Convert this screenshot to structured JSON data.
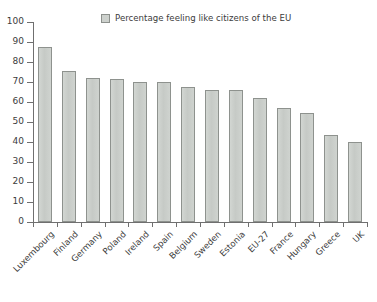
{
  "chart_data": {
    "type": "bar",
    "title": "",
    "subtitle": "",
    "xlabel": "",
    "ylabel": "",
    "ylim": [
      0,
      100
    ],
    "ytick_step": 10,
    "yticks": [
      0,
      10,
      20,
      30,
      40,
      50,
      60,
      70,
      80,
      90,
      100
    ],
    "grid": false,
    "legend_position": "top-center",
    "legend": [
      "Percentage feeling like citizens of the EU"
    ],
    "categories": [
      "Luxembourg",
      "Finland",
      "Germany",
      "Poland",
      "Ireland",
      "Spain",
      "Belgium",
      "Sweden",
      "Estonia",
      "EU-27",
      "France",
      "Hungary",
      "Greece",
      "UK"
    ],
    "series": [
      {
        "name": "Percentage feeling like citizens of the EU",
        "values": [
          87.5,
          75.5,
          72,
          71.5,
          70,
          70,
          67.5,
          66,
          66,
          62,
          57,
          54.5,
          43.5,
          40
        ]
      }
    ],
    "values": [
      87.5,
      75.5,
      72,
      71.5,
      70,
      70,
      67.5,
      66,
      66,
      62,
      57,
      54.5,
      43.5,
      40
    ],
    "colors": {
      "bar_fill": "#cdd1cd",
      "bar_border": "#8e928e",
      "axis": "#6f6f6f",
      "text": "#3c3c3c",
      "background": "#ffffff"
    }
  }
}
